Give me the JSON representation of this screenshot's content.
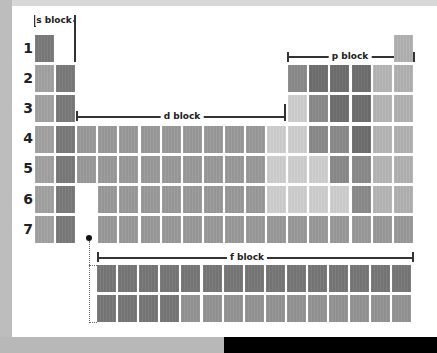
{
  "diagram": {
    "type": "periodic-table-blocks",
    "row_labels": [
      "1",
      "2",
      "3",
      "4",
      "5",
      "6",
      "7"
    ],
    "block_labels": {
      "s": "s block",
      "p": "p block",
      "d": "d block",
      "f": "f block"
    },
    "colors": {
      "A": "#7a7a7a",
      "B": "#a2a2a2",
      "C": "#9a9a9a",
      "D": "#cfcfcf",
      "E": "#8a8a8a",
      "F": "#6e6e6e",
      "G": "#b6b6b6",
      "H": "#b2b2b2",
      "I": "#949494",
      "J": "#777777"
    },
    "main_grid": [
      {
        "row": 1,
        "cells": [
          {
            "col": 1,
            "c": "A"
          },
          {
            "col": 18,
            "c": "H"
          }
        ]
      },
      {
        "row": 2,
        "cells": [
          {
            "col": 1,
            "c": "B"
          },
          {
            "col": 2,
            "c": "A"
          },
          {
            "col": 13,
            "c": "E"
          },
          {
            "col": 14,
            "c": "F"
          },
          {
            "col": 15,
            "c": "F"
          },
          {
            "col": 16,
            "c": "F"
          },
          {
            "col": 17,
            "c": "G"
          },
          {
            "col": 18,
            "c": "H"
          }
        ]
      },
      {
        "row": 3,
        "cells": [
          {
            "col": 1,
            "c": "B"
          },
          {
            "col": 2,
            "c": "A"
          },
          {
            "col": 13,
            "c": "D"
          },
          {
            "col": 14,
            "c": "E"
          },
          {
            "col": 15,
            "c": "F"
          },
          {
            "col": 16,
            "c": "F"
          },
          {
            "col": 17,
            "c": "G"
          },
          {
            "col": 18,
            "c": "H"
          }
        ]
      },
      {
        "row": 4,
        "cells": [
          {
            "col": 1,
            "c": "B"
          },
          {
            "col": 2,
            "c": "A"
          },
          {
            "col": 3,
            "c": "C"
          },
          {
            "col": 4,
            "c": "C"
          },
          {
            "col": 5,
            "c": "C"
          },
          {
            "col": 6,
            "c": "C"
          },
          {
            "col": 7,
            "c": "C"
          },
          {
            "col": 8,
            "c": "C"
          },
          {
            "col": 9,
            "c": "C"
          },
          {
            "col": 10,
            "c": "C"
          },
          {
            "col": 11,
            "c": "C"
          },
          {
            "col": 12,
            "c": "D"
          },
          {
            "col": 13,
            "c": "D"
          },
          {
            "col": 14,
            "c": "E"
          },
          {
            "col": 15,
            "c": "E"
          },
          {
            "col": 16,
            "c": "F"
          },
          {
            "col": 17,
            "c": "G"
          },
          {
            "col": 18,
            "c": "H"
          }
        ]
      },
      {
        "row": 5,
        "cells": [
          {
            "col": 1,
            "c": "B"
          },
          {
            "col": 2,
            "c": "A"
          },
          {
            "col": 3,
            "c": "C"
          },
          {
            "col": 4,
            "c": "C"
          },
          {
            "col": 5,
            "c": "C"
          },
          {
            "col": 6,
            "c": "C"
          },
          {
            "col": 7,
            "c": "C"
          },
          {
            "col": 8,
            "c": "C"
          },
          {
            "col": 9,
            "c": "C"
          },
          {
            "col": 10,
            "c": "C"
          },
          {
            "col": 11,
            "c": "C"
          },
          {
            "col": 12,
            "c": "D"
          },
          {
            "col": 13,
            "c": "D"
          },
          {
            "col": 14,
            "c": "D"
          },
          {
            "col": 15,
            "c": "E"
          },
          {
            "col": 16,
            "c": "E"
          },
          {
            "col": 17,
            "c": "G"
          },
          {
            "col": 18,
            "c": "H"
          }
        ]
      },
      {
        "row": 6,
        "cells": [
          {
            "col": 1,
            "c": "B"
          },
          {
            "col": 2,
            "c": "A"
          },
          {
            "col": 4,
            "c": "C"
          },
          {
            "col": 5,
            "c": "C"
          },
          {
            "col": 6,
            "c": "C"
          },
          {
            "col": 7,
            "c": "C"
          },
          {
            "col": 8,
            "c": "C"
          },
          {
            "col": 9,
            "c": "C"
          },
          {
            "col": 10,
            "c": "C"
          },
          {
            "col": 11,
            "c": "C"
          },
          {
            "col": 12,
            "c": "D"
          },
          {
            "col": 13,
            "c": "D"
          },
          {
            "col": 14,
            "c": "D"
          },
          {
            "col": 15,
            "c": "D"
          },
          {
            "col": 16,
            "c": "E"
          },
          {
            "col": 17,
            "c": "G"
          },
          {
            "col": 18,
            "c": "H"
          }
        ]
      },
      {
        "row": 7,
        "cells": [
          {
            "col": 1,
            "c": "B"
          },
          {
            "col": 2,
            "c": "A"
          },
          {
            "col": 4,
            "c": "C"
          },
          {
            "col": 5,
            "c": "C"
          },
          {
            "col": 6,
            "c": "C"
          },
          {
            "col": 7,
            "c": "C"
          },
          {
            "col": 8,
            "c": "C"
          },
          {
            "col": 9,
            "c": "C"
          },
          {
            "col": 10,
            "c": "C"
          },
          {
            "col": 11,
            "c": "C"
          },
          {
            "col": 12,
            "c": "C"
          },
          {
            "col": 13,
            "c": "C"
          },
          {
            "col": 14,
            "c": "C"
          },
          {
            "col": 15,
            "c": "C"
          },
          {
            "col": 16,
            "c": "C"
          },
          {
            "col": 17,
            "c": "C"
          },
          {
            "col": 18,
            "c": "C"
          }
        ]
      }
    ],
    "f_block": [
      {
        "row": 1,
        "colors": [
          "J",
          "J",
          "J",
          "J",
          "J",
          "J",
          "J",
          "J",
          "J",
          "J",
          "J",
          "J",
          "J",
          "J",
          "J"
        ]
      },
      {
        "row": 2,
        "colors": [
          "J",
          "J",
          "J",
          "J",
          "I",
          "I",
          "I",
          "I",
          "I",
          "I",
          "I",
          "I",
          "I",
          "I",
          "I"
        ]
      }
    ]
  }
}
